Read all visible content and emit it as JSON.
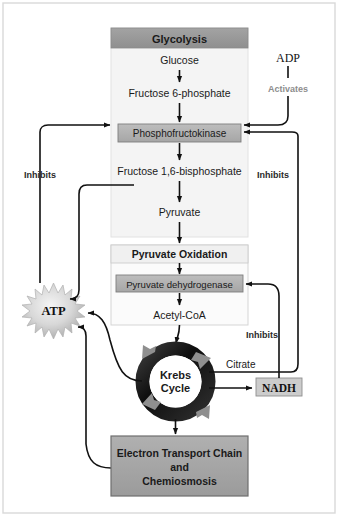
{
  "diagram": {
    "title_text_present": false,
    "colors": {
      "header_gray": "#9a9a9a",
      "panel_fill": "#f2f2f2",
      "enzyme_fill": "#b2b2b2",
      "etc_fill": "#a6a6a6",
      "nadh_fill": "#cccccc",
      "atp_fill": "#cfcfcf",
      "ring_dark": "#161616",
      "ring_arrow": "#8a8a8a",
      "line_black": "#111111",
      "activates_gray": "#8d8d8d",
      "outer_border": "#bdbdbd"
    },
    "panels": [
      {
        "id": "glycolysis",
        "header": "Glycolysis",
        "steps": [
          "Glucose",
          "Fructose 6-phosphate",
          "Fructose 1,6-bisphosphate",
          "Pyruvate"
        ],
        "enzyme": "Phosphofructokinase"
      },
      {
        "id": "pyruvate-oxidation",
        "header": "Pyruvate Oxidation",
        "steps": [
          "Acetyl-CoA"
        ],
        "enzyme": "Pyruvate dehydrogenase"
      }
    ],
    "cycle": {
      "line1": "Krebs",
      "line2": "Cycle"
    },
    "nodes": {
      "atp": "ATP",
      "nadh": "NADH",
      "adp": "ADP",
      "citrate": "Citrate",
      "etc_line1": "Electron Transport Chain",
      "etc_line2": "and",
      "etc_line3": "Chemiosmosis"
    },
    "regulation_labels": {
      "activates": "Activates",
      "inhibits_left": "Inhibits",
      "inhibits_right_upper": "Inhibits",
      "inhibits_right_lower": "Inhibits"
    }
  }
}
